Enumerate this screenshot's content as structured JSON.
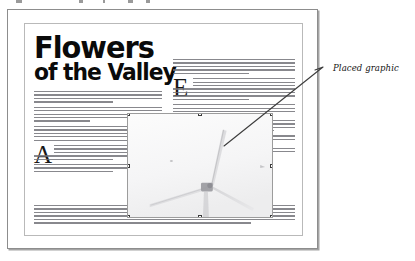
{
  "window": {
    "name": "document-window"
  },
  "document": {
    "masthead": {
      "line1": "Flowers",
      "line2": "of the Valley"
    },
    "drop_caps": {
      "left_column": "A",
      "right_column": "E"
    },
    "body_text_style": "greeked",
    "columns": 2
  },
  "placed_graphic": {
    "name": "placed-graphic",
    "selected": true,
    "subject": "wind-turbine-photo",
    "handle_count": 8,
    "border_color": "#9c9c9c",
    "handle_fill": "#ffffff",
    "handle_stroke": "#3b3b3b"
  },
  "annotation": {
    "label": "Placed graphic",
    "leader_line_color": "#3d3d3d"
  },
  "colors": {
    "page_background": "#ffffff",
    "frame_border": "#8d8d8d",
    "page_border": "#b9b9b9",
    "headline": "#0a0a0a",
    "body_text": "#6e6e74"
  }
}
